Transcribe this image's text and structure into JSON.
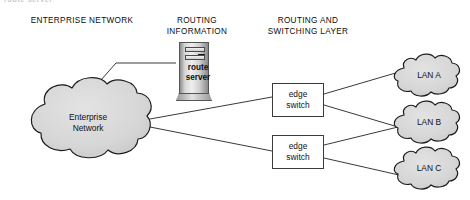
{
  "diagram": {
    "clipped_header_fragment": "route server",
    "column_headers": [
      {
        "id": "enterprise",
        "label": "ENTERPRISE NETWORK"
      },
      {
        "id": "routing_information",
        "label": "ROUTING\nINFORMATION"
      },
      {
        "id": "routing_switching_layer",
        "label": "ROUTING AND\nSWITCHING LAYER"
      }
    ],
    "nodes": {
      "enterprise_cloud": {
        "label": "Enterprise\nNetwork",
        "shape": "cloud",
        "fill": "#d4d4d4",
        "stroke": "#1c1c1c"
      },
      "route_server": {
        "label": "route\nserver",
        "shape": "tower-server"
      },
      "edge_switches": [
        {
          "id": "edge-switch-1",
          "label": "edge\nswitch",
          "shape": "rectangle"
        },
        {
          "id": "edge-switch-2",
          "label": "edge\nswitch",
          "shape": "rectangle"
        }
      ],
      "lan_clouds": [
        {
          "id": "lan-a",
          "label": "LAN A",
          "shape": "cloud",
          "fill": "#d4d4d4"
        },
        {
          "id": "lan-b",
          "label": "LAN B",
          "shape": "cloud",
          "fill": "#d4d4d4"
        },
        {
          "id": "lan-c",
          "label": "LAN C",
          "shape": "cloud",
          "fill": "#d4d4d4"
        }
      ]
    },
    "links": [
      {
        "from": "route_server",
        "to": "enterprise_cloud"
      },
      {
        "from": "enterprise_cloud",
        "to": "edge-switch-1"
      },
      {
        "from": "enterprise_cloud",
        "to": "edge-switch-2"
      },
      {
        "from": "edge-switch-1",
        "to": "lan-a"
      },
      {
        "from": "edge-switch-1",
        "to": "lan-b"
      },
      {
        "from": "edge-switch-2",
        "to": "lan-b"
      },
      {
        "from": "edge-switch-2",
        "to": "lan-c"
      }
    ],
    "colors": {
      "cloud_fill": "#d4d4d4",
      "cloud_stroke": "#1c1c1c",
      "line": "#3a3a3a",
      "box_border": "#3b3b3b",
      "text": "#0d0d0d",
      "background": "#ffffff"
    }
  }
}
